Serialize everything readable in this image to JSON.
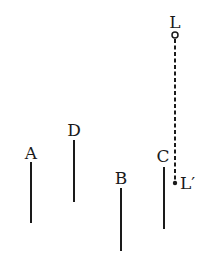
{
  "diagram": {
    "stroke_color": "#1a1a1a",
    "poles": [
      {
        "label": "A",
        "x": 31,
        "label_y": 159,
        "y1": 162,
        "y2": 223
      },
      {
        "label": "D",
        "x": 74,
        "label_y": 136,
        "y1": 140,
        "y2": 202
      },
      {
        "label": "B",
        "x": 121,
        "label_y": 184,
        "y1": 188,
        "y2": 251
      },
      {
        "label": "C",
        "x": 164,
        "label_y": 162,
        "y1": 167,
        "y2": 229
      }
    ],
    "light": {
      "label": "L",
      "projection_label": "L′",
      "x": 175,
      "label_y": 28,
      "circle_y": 35,
      "dot_y": 183
    }
  }
}
